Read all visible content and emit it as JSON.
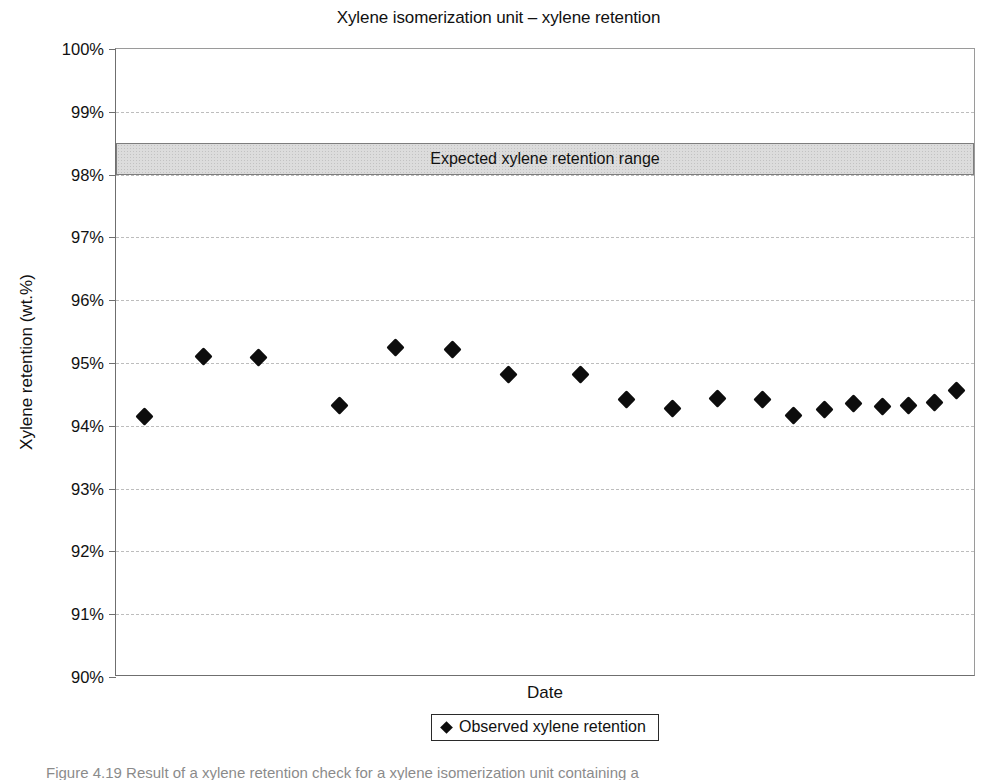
{
  "figure": {
    "caption": "Figure 4.19  Result of a xylene retention check for a xylene isomerization unit containing a"
  },
  "chart_data": {
    "type": "scatter",
    "title": "Xylene isomerization unit – xylene retention",
    "xlabel": "Date",
    "ylabel": "Xylene retention (wt.%)",
    "ylim": [
      90,
      100
    ],
    "ytick_step": 1,
    "ytick_labels": [
      "100%",
      "99%",
      "98%",
      "97%",
      "96%",
      "95%",
      "94%",
      "93%",
      "92%",
      "91%",
      "90%"
    ],
    "ytick_values": [
      100,
      99,
      98,
      97,
      96,
      95,
      94,
      93,
      92,
      91,
      90
    ],
    "xtick_labels": [],
    "grid": true,
    "grid_axis": "y",
    "legend": {
      "position": "bottom-center",
      "entries": [
        {
          "label": "Observed xylene retention",
          "marker": "diamond",
          "color": "#0d0d0d"
        }
      ]
    },
    "bands": [
      {
        "name": "expected-range",
        "label": "Expected xylene retention range",
        "y_low": 98.0,
        "y_high": 98.5,
        "fill": "#dcdcdc",
        "border": "#7d7d7d"
      }
    ],
    "series": [
      {
        "name": "Observed xylene retention",
        "marker": "diamond",
        "color": "#0d0d0d",
        "x_positions_pct": [
          3.3,
          10.2,
          16.6,
          26.0,
          32.6,
          39.2,
          45.7,
          54.1,
          59.5,
          64.9,
          70.1,
          75.3,
          79.0,
          82.6,
          86.0,
          89.3,
          92.4,
          95.4,
          98.0
        ],
        "values": [
          94.15,
          95.1,
          95.08,
          94.33,
          95.25,
          95.22,
          94.82,
          94.81,
          94.42,
          94.27,
          94.44,
          94.42,
          94.17,
          94.26,
          94.35,
          94.3,
          94.33,
          94.37,
          94.56
        ]
      }
    ]
  }
}
